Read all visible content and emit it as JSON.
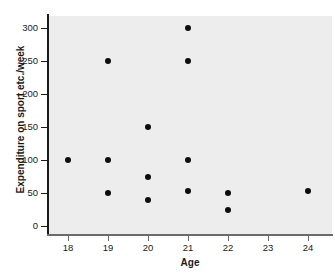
{
  "chart_data": {
    "type": "scatter",
    "title": "",
    "xlabel": "Age",
    "ylabel": "Expenditure on sport etc./week",
    "xlim": [
      17.5,
      24.6
    ],
    "ylim": [
      -12,
      318
    ],
    "grid": false,
    "legend": null,
    "marker": {
      "shape": "circle",
      "color": "#0d0d0d",
      "size": 6
    },
    "plot_background": "#ededed",
    "figure_background": "#ffffff",
    "axis_color": "#1a1a1a",
    "xticks": [
      18,
      19,
      20,
      21,
      22,
      23,
      24
    ],
    "xtick_labels": [
      "18",
      "19",
      "20",
      "21",
      "22",
      "23",
      "24"
    ],
    "yticks": [
      0,
      50,
      100,
      150,
      200,
      250,
      300
    ],
    "ytick_labels": [
      "0",
      "50",
      "100",
      "150",
      "200",
      "250",
      "300"
    ],
    "points": [
      {
        "x": 18,
        "y": 100
      },
      {
        "x": 19,
        "y": 250
      },
      {
        "x": 19,
        "y": 100
      },
      {
        "x": 19,
        "y": 50
      },
      {
        "x": 20,
        "y": 150
      },
      {
        "x": 20,
        "y": 75
      },
      {
        "x": 20,
        "y": 40
      },
      {
        "x": 21,
        "y": 300
      },
      {
        "x": 21,
        "y": 250
      },
      {
        "x": 21,
        "y": 100
      },
      {
        "x": 21,
        "y": 53
      },
      {
        "x": 22,
        "y": 50
      },
      {
        "x": 22,
        "y": 25
      },
      {
        "x": 24,
        "y": 53
      }
    ]
  }
}
